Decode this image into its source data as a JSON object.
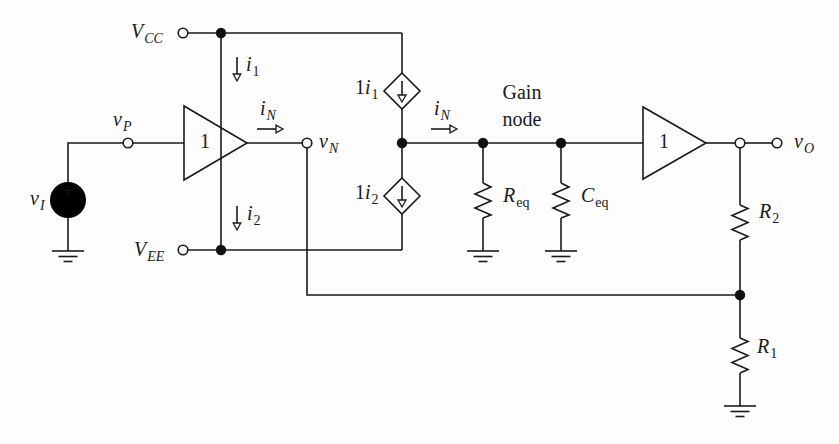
{
  "figure": {
    "type": "circuit-schematic",
    "colors": {
      "line": "#1a1a1a",
      "background": "#fdfdfd"
    }
  },
  "labels": {
    "vcc": {
      "base": "V",
      "sub": "CC"
    },
    "vee": {
      "base": "V",
      "sub": "EE"
    },
    "vi": {
      "base": "v",
      "sub": "I"
    },
    "vp": {
      "base": "v",
      "sub": "P"
    },
    "vn": {
      "base": "v",
      "sub": "N"
    },
    "vo": {
      "base": "v",
      "sub": "O"
    },
    "i1": {
      "base": "i",
      "sub": "1"
    },
    "i2": {
      "base": "i",
      "sub": "2"
    },
    "in1": {
      "base": "i",
      "sub": "N"
    },
    "in2": {
      "base": "i",
      "sub": "N"
    },
    "dep1": {
      "pre": "1",
      "base": "i",
      "sub": "1"
    },
    "dep2": {
      "pre": "1",
      "base": "i",
      "sub": "2"
    },
    "req": {
      "base": "R",
      "sub": "eq"
    },
    "ceq": {
      "base": "C",
      "sub": "eq"
    },
    "r2": {
      "base": "R",
      "sub": "2"
    },
    "r1": {
      "base": "R",
      "sub": "1"
    },
    "gain_node": "Gain node",
    "buffer1_gain": "1",
    "buffer2_gain": "1",
    "source_plus": "+"
  }
}
